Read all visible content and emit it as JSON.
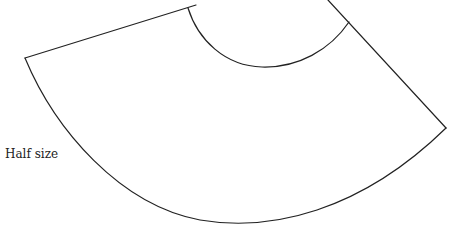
{
  "diagram": {
    "type": "sewing-pattern-piece",
    "scale_label": "Half size",
    "colors": {
      "line": "#222222",
      "background": "#ffffff",
      "text": "#222222"
    },
    "geometry": {
      "left_corner": [
        25,
        58
      ],
      "top_edge_waist_point": [
        188,
        8
      ],
      "top_edge_exit": [
        195,
        6
      ],
      "right_edge_entry": [
        328,
        0
      ],
      "right_edge_waist_point": [
        349,
        22
      ],
      "right_corner": [
        446,
        128
      ],
      "hem_lowest_point": [
        240,
        225
      ],
      "waist_lowest_point": [
        262,
        67
      ]
    }
  }
}
